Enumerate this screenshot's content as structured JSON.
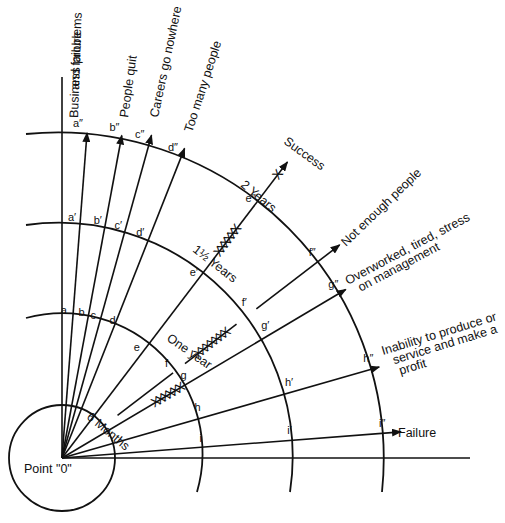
{
  "diagram": {
    "origin_label": "Point \"0\"",
    "axis_symbol": "0",
    "time_rings": [
      {
        "label": "6 Months"
      },
      {
        "label": "One year"
      },
      {
        "label": "1½ Years",
        "prefix": "1¹/₂",
        "suffix": "Years"
      },
      {
        "label": "2 Years"
      }
    ],
    "rays": [
      {
        "id": "a",
        "outcome": "Business problems and failure",
        "lines": [
          "Business problems",
          "and failure"
        ],
        "points": [
          "a",
          "a′",
          "a″"
        ]
      },
      {
        "id": "b",
        "outcome": "People quit",
        "lines": [
          "People quit"
        ],
        "points": [
          "b",
          "b′",
          "b″"
        ]
      },
      {
        "id": "c",
        "outcome": "Careers go nowhere",
        "lines": [
          "Careers go nowhere"
        ],
        "points": [
          "c",
          "c′",
          "c″"
        ]
      },
      {
        "id": "d",
        "outcome": "Too many people",
        "lines": [
          "Too many people"
        ],
        "points": [
          "d",
          "d′",
          "d″"
        ]
      },
      {
        "id": "e",
        "outcome": "Success",
        "lines": [
          "Success"
        ],
        "points": [
          "e",
          "e′",
          "e″"
        ]
      },
      {
        "id": "f",
        "outcome": "Not enough people",
        "lines": [
          "Not enough people"
        ],
        "points": [
          "f",
          "f′",
          "f″"
        ]
      },
      {
        "id": "g",
        "outcome": "Overworked, tired, stress on management",
        "lines": [
          "Overworked, tired, stress",
          "on management"
        ],
        "points": [
          "g",
          "g′",
          "g″"
        ]
      },
      {
        "id": "h",
        "outcome": "Inability to produce or service and make a profit",
        "lines": [
          "Inability to produce or",
          "service and make a",
          "profit"
        ],
        "points": [
          "h",
          "h′",
          "h″"
        ]
      },
      {
        "id": "i",
        "outcome": "Failure",
        "lines": [
          "Failure"
        ],
        "points": [
          "i",
          "i′",
          "i″"
        ]
      }
    ],
    "cross_marks": {
      "g_six_months": "XXXXXX",
      "f_one_year": "XXXXXXX",
      "e_one_half_years": "XXXXXX",
      "e_two_years": "X"
    }
  }
}
